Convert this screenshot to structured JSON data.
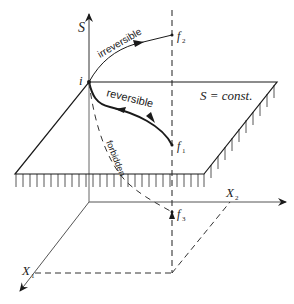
{
  "diagram": {
    "type": "thermodynamic entropy diagram",
    "axes": {
      "vertical": {
        "label": "S"
      },
      "horizontal_right": {
        "label": "X",
        "subscript": "2"
      },
      "diagonal_front": {
        "label": "X",
        "subscript": "1"
      }
    },
    "plane": {
      "label": "S = const."
    },
    "points": {
      "initial": {
        "label": "i"
      },
      "final_above": {
        "label": "f",
        "subscript": "2"
      },
      "final_on_plane": {
        "label": "f",
        "subscript": "1"
      },
      "final_below": {
        "label": "f",
        "subscript": "3"
      }
    },
    "paths": {
      "irreversible": {
        "label": "irreversible"
      },
      "reversible": {
        "label": "reversible"
      },
      "forbidden": {
        "label": "forbidden"
      }
    },
    "colors": {
      "stroke": "#1a1a1a",
      "light_stroke": "#555555",
      "background": "#ffffff"
    }
  }
}
